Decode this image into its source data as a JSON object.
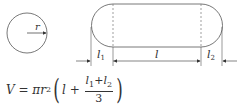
{
  "diagram": {
    "circle": {
      "label_radius": "r"
    },
    "capsule": {
      "label_l1": "l",
      "label_l1_sub": "1",
      "label_l": "l",
      "label_l2": "l",
      "label_l2_sub": "2"
    },
    "formula": {
      "lhs": "V",
      "eq": " = ",
      "pi": "π",
      "r": "r",
      "r_sup": "2",
      "l": "l",
      "plus": " + ",
      "num_l1": "l",
      "num_l1_sub": "1",
      "num_plus": "+",
      "num_l2": "l",
      "num_l2_sub": "2",
      "den": "3"
    }
  }
}
